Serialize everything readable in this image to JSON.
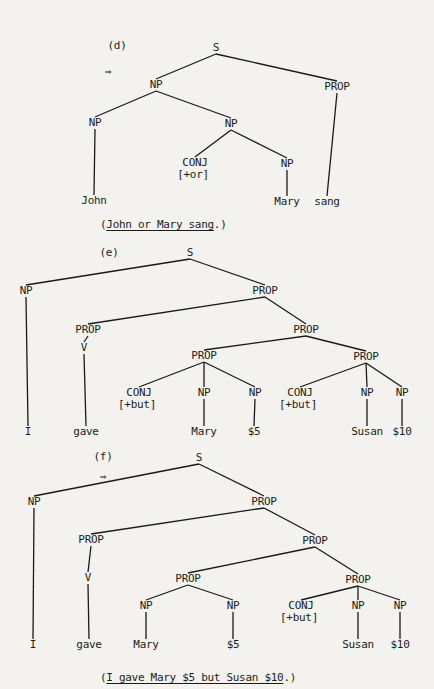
{
  "trees": [
    {
      "id": "d",
      "label": "(d)",
      "arrow": "⇒",
      "caption": {
        "open": "(",
        "sentence": "John or Mary sang",
        "close": ".)"
      },
      "nodes": [
        {
          "id": "S",
          "text": "S"
        },
        {
          "id": "NP1",
          "text": "NP"
        },
        {
          "id": "PROP1",
          "text": "PROP"
        },
        {
          "id": "NP2",
          "text": "NP"
        },
        {
          "id": "NP3",
          "text": "NP"
        },
        {
          "id": "CONJ1",
          "text": "CONJ",
          "feature": "[+or]"
        },
        {
          "id": "NP4",
          "text": "NP"
        },
        {
          "id": "w_john",
          "text": "John"
        },
        {
          "id": "w_mary",
          "text": "Mary"
        },
        {
          "id": "w_sang",
          "text": "sang"
        }
      ],
      "edges": [
        [
          "S",
          "NP1"
        ],
        [
          "S",
          "PROP1"
        ],
        [
          "NP1",
          "NP2"
        ],
        [
          "NP1",
          "NP3"
        ],
        [
          "NP3",
          "CONJ1"
        ],
        [
          "NP3",
          "NP4"
        ],
        [
          "NP2",
          "w_john"
        ],
        [
          "NP4",
          "w_mary"
        ],
        [
          "PROP1",
          "w_sang"
        ]
      ]
    },
    {
      "id": "e",
      "label": "(e)",
      "arrow": "",
      "caption": null,
      "nodes": [
        {
          "id": "S",
          "text": "S"
        },
        {
          "id": "NP1",
          "text": "NP"
        },
        {
          "id": "PROP1",
          "text": "PROP"
        },
        {
          "id": "PROP2",
          "text": "PROP"
        },
        {
          "id": "V",
          "text": "V"
        },
        {
          "id": "PROP3",
          "text": "PROP"
        },
        {
          "id": "PROP4",
          "text": "PROP"
        },
        {
          "id": "PROP5",
          "text": "PROP"
        },
        {
          "id": "CONJ1",
          "text": "CONJ",
          "feature": "[+but]"
        },
        {
          "id": "NP2",
          "text": "NP"
        },
        {
          "id": "NP3",
          "text": "NP"
        },
        {
          "id": "CONJ2",
          "text": "CONJ",
          "feature": "[+but]"
        },
        {
          "id": "NP4",
          "text": "NP"
        },
        {
          "id": "NP5",
          "text": "NP"
        },
        {
          "id": "w_i",
          "text": "I"
        },
        {
          "id": "w_gave",
          "text": "gave"
        },
        {
          "id": "w_mary",
          "text": "Mary"
        },
        {
          "id": "w_5",
          "text": "$5"
        },
        {
          "id": "w_susan",
          "text": "Susan"
        },
        {
          "id": "w_10",
          "text": "$10"
        }
      ],
      "edges": [
        [
          "S",
          "NP1"
        ],
        [
          "S",
          "PROP1"
        ],
        [
          "PROP1",
          "PROP2"
        ],
        [
          "PROP1",
          "PROP3"
        ],
        [
          "PROP2",
          "V"
        ],
        [
          "PROP3",
          "PROP4"
        ],
        [
          "PROP3",
          "PROP5"
        ],
        [
          "PROP4",
          "CONJ1"
        ],
        [
          "PROP4",
          "NP2"
        ],
        [
          "PROP4",
          "NP3"
        ],
        [
          "PROP5",
          "CONJ2"
        ],
        [
          "PROP5",
          "NP4"
        ],
        [
          "PROP5",
          "NP5"
        ],
        [
          "NP1",
          "w_i"
        ],
        [
          "V",
          "w_gave"
        ],
        [
          "NP2",
          "w_mary"
        ],
        [
          "NP3",
          "w_5"
        ],
        [
          "NP4",
          "w_susan"
        ],
        [
          "NP5",
          "w_10"
        ]
      ]
    },
    {
      "id": "f",
      "label": "(f)",
      "arrow": "⇒",
      "caption": {
        "open": "(",
        "sentence": "I gave Mary $5 but Susan $10",
        "close": ".)"
      },
      "nodes": [
        {
          "id": "S",
          "text": "S"
        },
        {
          "id": "NP1",
          "text": "NP"
        },
        {
          "id": "PROP1",
          "text": "PROP"
        },
        {
          "id": "PROP2",
          "text": "PROP"
        },
        {
          "id": "V",
          "text": "V"
        },
        {
          "id": "PROP3",
          "text": "PROP"
        },
        {
          "id": "PROP4",
          "text": "PROP"
        },
        {
          "id": "PROP5",
          "text": "PROP"
        },
        {
          "id": "NP2",
          "text": "NP"
        },
        {
          "id": "NP3",
          "text": "NP"
        },
        {
          "id": "CONJ1",
          "text": "CONJ",
          "feature": "[+but]"
        },
        {
          "id": "NP4",
          "text": "NP"
        },
        {
          "id": "NP5",
          "text": "NP"
        },
        {
          "id": "w_i",
          "text": "I"
        },
        {
          "id": "w_gave",
          "text": "gave"
        },
        {
          "id": "w_mary",
          "text": "Mary"
        },
        {
          "id": "w_5",
          "text": "$5"
        },
        {
          "id": "w_susan",
          "text": "Susan"
        },
        {
          "id": "w_10",
          "text": "$10"
        }
      ],
      "edges": [
        [
          "S",
          "NP1"
        ],
        [
          "S",
          "PROP1"
        ],
        [
          "PROP1",
          "PROP2"
        ],
        [
          "PROP1",
          "PROP3"
        ],
        [
          "PROP2",
          "V"
        ],
        [
          "PROP3",
          "PROP4"
        ],
        [
          "PROP3",
          "PROP5"
        ],
        [
          "PROP4",
          "NP2"
        ],
        [
          "PROP4",
          "NP3"
        ],
        [
          "PROP5",
          "CONJ1"
        ],
        [
          "PROP5",
          "NP4"
        ],
        [
          "PROP5",
          "NP5"
        ],
        [
          "NP1",
          "w_i"
        ],
        [
          "V",
          "w_gave"
        ],
        [
          "NP2",
          "w_mary"
        ],
        [
          "NP3",
          "w_5"
        ],
        [
          "NP4",
          "w_susan"
        ],
        [
          "NP5",
          "w_10"
        ]
      ]
    }
  ]
}
